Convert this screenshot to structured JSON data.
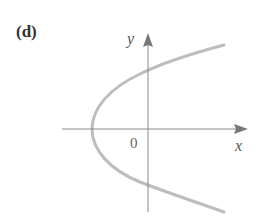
{
  "panel": {
    "label": "(d)"
  },
  "axes": {
    "x_label": "x",
    "y_label": "y",
    "origin_label": "0",
    "axis_color": "#777777"
  },
  "curve": {
    "description": "Parabola opening to the right, vertex on negative x-axis",
    "color": "#bdbdbd",
    "vertex": "left of origin on x-axis",
    "crosses_y_axis": [
      "above origin",
      "below origin"
    ]
  }
}
